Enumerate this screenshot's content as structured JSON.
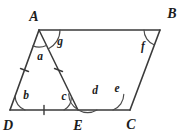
{
  "figure": {
    "kind": "geometry-diagram",
    "shape": "parallelogram-with-cevian",
    "background_color": "#ffffff",
    "stroke_color": "#3a3a3a",
    "arc_color": "#4a4a4a",
    "label_color": "#1c1c1c",
    "width": 187,
    "height": 137
  },
  "vertices": [
    {
      "id": "A",
      "label": "A",
      "x": 39,
      "y": 30,
      "label_x": 34,
      "label_y": 21
    },
    {
      "id": "B",
      "label": "B",
      "x": 160,
      "y": 30,
      "label_x": 172,
      "label_y": 18
    },
    {
      "id": "C",
      "label": "C",
      "x": 130,
      "y": 110,
      "label_x": 131,
      "label_y": 127
    },
    {
      "id": "D",
      "label": "D",
      "x": 10,
      "y": 110,
      "label_x": 4,
      "label_y": 128
    },
    {
      "id": "E",
      "label": "E",
      "x": 78,
      "y": 110,
      "label_x": 77,
      "label_y": 128
    }
  ],
  "edges": [
    {
      "name": "side-AB",
      "from": "A",
      "to": "B"
    },
    {
      "name": "side-BC",
      "from": "B",
      "to": "C"
    },
    {
      "name": "side-DC",
      "from": "D",
      "to": "C"
    },
    {
      "name": "side-AD",
      "from": "A",
      "to": "D"
    },
    {
      "name": "cevian-AE",
      "from": "A",
      "to": "E"
    }
  ],
  "tick_marks": [
    {
      "name": "tick-AD",
      "segment": "AD",
      "x": 24.5,
      "y": 70,
      "angle": 69
    },
    {
      "name": "tick-AE",
      "segment": "AE",
      "x": 58.5,
      "y": 70,
      "angle": 64
    },
    {
      "name": "tick-DE",
      "segment": "DE",
      "x": 44,
      "y": 110,
      "angle": 0
    }
  ],
  "angles": [
    {
      "id": "a",
      "label": "a",
      "vertex": "A",
      "label_x": 40,
      "label_y": 60,
      "arc_radius": 17
    },
    {
      "id": "g",
      "label": "g",
      "vertex": "A",
      "label_x": 60,
      "label_y": 45,
      "arc_radius": 21
    },
    {
      "id": "b",
      "label": "b",
      "vertex": "D",
      "label_x": 26,
      "label_y": 98,
      "arc_radius": 15
    },
    {
      "id": "c",
      "label": "c",
      "vertex": "E",
      "label_x": 64,
      "label_y": 99,
      "arc_radius": 14
    },
    {
      "id": "d",
      "label": "d",
      "vertex": "E",
      "label_x": 95,
      "label_y": 93,
      "arc_radius": 19
    },
    {
      "id": "e",
      "label": "e",
      "vertex": "C",
      "label_x": 117,
      "label_y": 91,
      "arc_radius": 17
    },
    {
      "id": "f",
      "label": "f",
      "vertex": "B",
      "label_x": 143,
      "label_y": 49,
      "arc_radius": 16
    }
  ]
}
